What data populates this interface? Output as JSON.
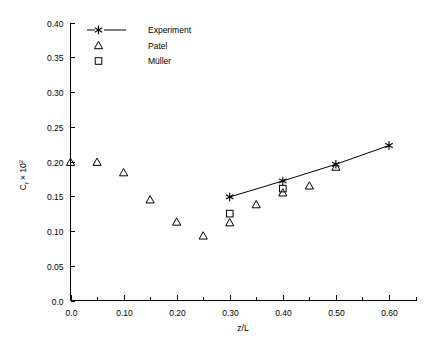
{
  "chart_data": {
    "type": "scatter",
    "title": "",
    "xlabel": "z/L",
    "ylabel": "C_f × 10²",
    "ylabel_parts": {
      "base": "C",
      "subscript": "f",
      "times": " × 10",
      "exponent": "2"
    },
    "xlim": [
      0.0,
      0.65
    ],
    "ylim": [
      0.0,
      0.4
    ],
    "xticks": [
      0.0,
      0.1,
      0.2,
      0.3,
      0.4,
      0.5,
      0.6
    ],
    "xtick_labels": [
      "0.0",
      "0.10",
      "0.20",
      "0.30",
      "0.40",
      "0.50",
      "0.60"
    ],
    "xminor_ticks": [
      0.05,
      0.15,
      0.25,
      0.35,
      0.45,
      0.55,
      0.65
    ],
    "yticks": [
      0.0,
      0.05,
      0.1,
      0.15,
      0.2,
      0.25,
      0.3,
      0.35,
      0.4
    ],
    "ytick_labels": [
      "0.0",
      "0.05",
      "0.10",
      "0.15",
      "0.20",
      "0.25",
      "0.30",
      "0.35",
      "0.40"
    ],
    "grid": false,
    "legend_position": "top-left",
    "series": [
      {
        "name": "Experiment",
        "marker": "star",
        "line": true,
        "x": [
          0.3,
          0.4,
          0.5,
          0.6
        ],
        "y": [
          0.149,
          0.172,
          0.196,
          0.223
        ]
      },
      {
        "name": "Patel",
        "marker": "triangle",
        "line": false,
        "x": [
          0.0,
          0.05,
          0.1,
          0.15,
          0.2,
          0.25,
          0.3,
          0.35,
          0.4,
          0.45,
          0.5
        ],
        "y": [
          0.199,
          0.199,
          0.184,
          0.145,
          0.113,
          0.093,
          0.112,
          0.138,
          0.155,
          0.165,
          0.192
        ]
      },
      {
        "name": "Müller",
        "marker": "square",
        "line": false,
        "x": [
          0.3,
          0.4
        ],
        "y": [
          0.125,
          0.161
        ]
      }
    ]
  },
  "legend": {
    "entries": [
      {
        "label": "Experiment",
        "marker": "star",
        "has_line": true
      },
      {
        "label": "Patel",
        "marker": "triangle",
        "has_line": false
      },
      {
        "label": "Müller",
        "marker": "square",
        "has_line": false
      }
    ]
  },
  "axes": {
    "x_title": "z/L",
    "y_title_base": "C",
    "y_title_sub": "f",
    "y_title_mid": " × 10",
    "y_title_sup": "2"
  },
  "colors": {
    "background": "#ffffff",
    "foreground": "#000000",
    "axis": "#000000",
    "series": "#000000"
  }
}
